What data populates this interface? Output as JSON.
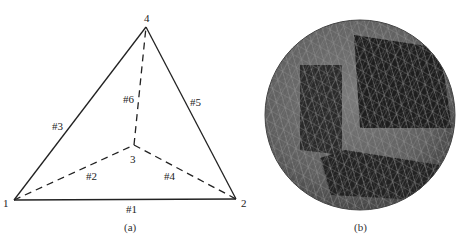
{
  "panel_a": {
    "caption": "(a)",
    "vertices": [
      {
        "id": "1",
        "label": "1",
        "x": 14,
        "y": 200
      },
      {
        "id": "2",
        "label": "2",
        "x": 236,
        "y": 199
      },
      {
        "id": "3",
        "label": "3",
        "x": 134,
        "y": 145
      },
      {
        "id": "4",
        "label": "4",
        "x": 146,
        "y": 27
      }
    ],
    "edges": [
      {
        "label": "#1",
        "from": "1",
        "to": "2",
        "style": "solid"
      },
      {
        "label": "#2",
        "from": "1",
        "to": "3",
        "style": "dashed"
      },
      {
        "label": "#3",
        "from": "1",
        "to": "4",
        "style": "solid"
      },
      {
        "label": "#4",
        "from": "3",
        "to": "2",
        "style": "dashed"
      },
      {
        "label": "#5",
        "from": "4",
        "to": "2",
        "style": "solid"
      },
      {
        "label": "#6",
        "from": "3",
        "to": "4",
        "style": "dashed"
      }
    ]
  },
  "panel_b": {
    "caption": "(b)",
    "description": "Tetrahedral-meshed sphere with a cut-away octant revealing interior mesh",
    "colors": {
      "surface": "#6a6a6a",
      "dark_face": "#1e1e1e",
      "mesh_line": "#9a9a9a"
    }
  }
}
